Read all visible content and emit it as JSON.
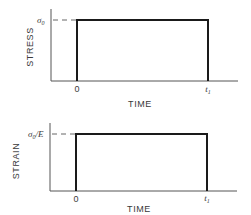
{
  "figure": {
    "panels": [
      {
        "id": "stress",
        "y_label": "STRESS",
        "x_label": "TIME",
        "level_label": "σ",
        "level_sub": "0",
        "level_suffix": "",
        "tick_start": "0",
        "tick_end_var": "t",
        "tick_end_sub": "1"
      },
      {
        "id": "strain",
        "y_label": "STRAIN",
        "x_label": "TIME",
        "level_label": "σ",
        "level_sub": "0",
        "level_suffix": "/E",
        "tick_start": "0",
        "tick_end_var": "t",
        "tick_end_sub": "1"
      }
    ]
  },
  "colors": {
    "pulse": "#1a1a1a",
    "axis": "#555555",
    "dash": "#666666"
  }
}
